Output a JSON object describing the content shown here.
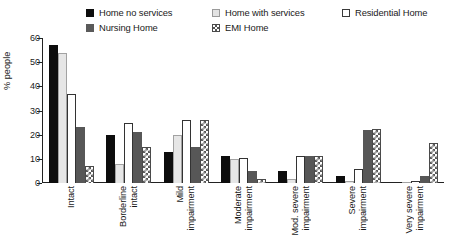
{
  "chart_data": {
    "type": "bar",
    "title": "",
    "xlabel": "",
    "ylabel": "% people",
    "ylim": [
      0,
      60
    ],
    "yticks": [
      0,
      10,
      20,
      30,
      40,
      50,
      60
    ],
    "grid": false,
    "legend_position": "top",
    "categories": [
      "Intact",
      "Borderline intact",
      "Mild impairment",
      "Moderate impairment",
      "Mod. severe impairment",
      "Severe impairment",
      "Very severe impairment"
    ],
    "category_lines": [
      [
        "Intact"
      ],
      [
        "Borderline",
        "intact"
      ],
      [
        "Mild",
        "impairment"
      ],
      [
        "Moderate",
        "impairment"
      ],
      [
        "Mod. severe",
        "impairment"
      ],
      [
        "Severe",
        "impairment"
      ],
      [
        "Very severe",
        "impairment"
      ]
    ],
    "series": [
      {
        "name": "Home no services",
        "fill": "solid-black",
        "color": "#0d0d0d",
        "values": [
          57,
          20,
          13,
          11,
          5,
          3,
          0
        ]
      },
      {
        "name": "Home with services",
        "fill": "light-gray",
        "color": "#e6e6e6",
        "values": [
          54,
          8,
          20,
          10,
          1.5,
          1,
          0.3
        ]
      },
      {
        "name": "Residential Home",
        "fill": "white-outline",
        "color": "#ffffff",
        "values": [
          37,
          25,
          26,
          10.5,
          11,
          6,
          1
        ]
      },
      {
        "name": "Nursing Home",
        "fill": "dark-gray",
        "color": "#575757",
        "values": [
          23,
          21,
          15,
          5,
          11,
          22,
          3
        ]
      },
      {
        "name": "EMI Home",
        "fill": "checker-pattern",
        "color": "#595959",
        "values": [
          7,
          15,
          26,
          1.5,
          11,
          22.5,
          16.5
        ]
      }
    ]
  },
  "legend": {
    "items": [
      {
        "label": "Home no services",
        "swatch": "sw-black"
      },
      {
        "label": "Home with services",
        "swatch": "sw-lightgry"
      },
      {
        "label": "Residential Home",
        "swatch": "sw-white"
      },
      {
        "label": "Nursing Home",
        "swatch": "sw-darkgry"
      },
      {
        "label": "EMI Home",
        "swatch": "sw-emi"
      }
    ]
  },
  "axis": {
    "y_title": "% people",
    "y_tick_labels": [
      "60",
      "50",
      "40",
      "30",
      "20",
      "10",
      "0"
    ]
  }
}
